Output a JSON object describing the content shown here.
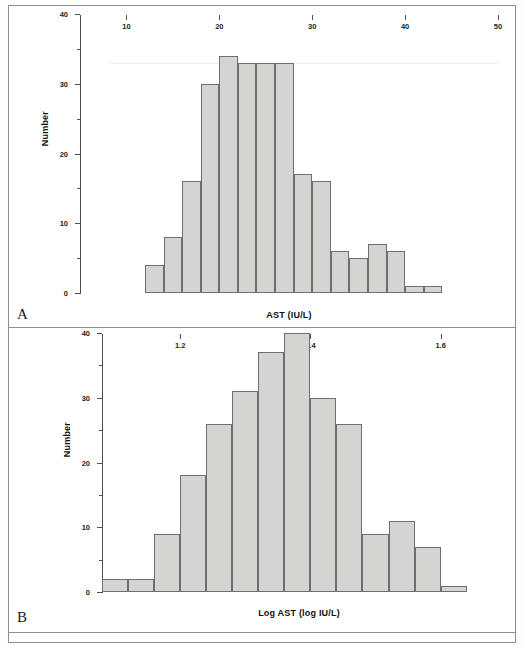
{
  "figure": {
    "panels": [
      {
        "letter": "A",
        "id": "panel-a",
        "xlabel": "AST (IU/L)",
        "ylabel": "Number"
      },
      {
        "letter": "B",
        "id": "panel-b",
        "xlabel": "Log AST (log IU/L)",
        "ylabel": "Number"
      }
    ]
  },
  "chart_data": [
    {
      "type": "bar",
      "title": "",
      "panel": "A",
      "xlabel": "AST (IU/L)",
      "ylabel": "Number",
      "xlim": [
        5,
        50
      ],
      "ylim": [
        0,
        40
      ],
      "xticks": [
        10,
        20,
        30,
        40,
        50
      ],
      "xtick_labels": [
        "10",
        "20",
        "30",
        "40",
        "50"
      ],
      "yticks": [
        0,
        10,
        20,
        30,
        40
      ],
      "ytick_labels": [
        "0",
        "10",
        "20",
        "30",
        "40"
      ],
      "bin_width": 2,
      "grid": false,
      "legend": false,
      "bins": [
        {
          "x0": 12,
          "x1": 14,
          "value": 4
        },
        {
          "x0": 14,
          "x1": 16,
          "value": 8
        },
        {
          "x0": 16,
          "x1": 18,
          "value": 16
        },
        {
          "x0": 18,
          "x1": 20,
          "value": 30
        },
        {
          "x0": 20,
          "x1": 22,
          "value": 34
        },
        {
          "x0": 22,
          "x1": 24,
          "value": 33
        },
        {
          "x0": 24,
          "x1": 26,
          "value": 33
        },
        {
          "x0": 26,
          "x1": 28,
          "value": 33
        },
        {
          "x0": 28,
          "x1": 30,
          "value": 17
        },
        {
          "x0": 30,
          "x1": 32,
          "value": 16
        },
        {
          "x0": 32,
          "x1": 34,
          "value": 6
        },
        {
          "x0": 34,
          "x1": 36,
          "value": 5
        },
        {
          "x0": 36,
          "x1": 38,
          "value": 7
        },
        {
          "x0": 38,
          "x1": 40,
          "value": 6
        },
        {
          "x0": 40,
          "x1": 42,
          "value": 1
        },
        {
          "x0": 42,
          "x1": 44,
          "value": 1
        }
      ]
    },
    {
      "type": "bar",
      "title": "",
      "panel": "B",
      "xlabel": "Log AST (log IU/L)",
      "ylabel": "Number",
      "xlim": [
        1.08,
        1.685
      ],
      "ylim": [
        0,
        40
      ],
      "xticks": [
        1.2,
        1.4,
        1.6
      ],
      "xtick_labels": [
        "1.2",
        "1.4",
        "1.6"
      ],
      "yticks": [
        0,
        10,
        20,
        30,
        40
      ],
      "ytick_labels": [
        "0",
        "10",
        "20",
        "30",
        "40"
      ],
      "bin_width": 0.04,
      "grid": false,
      "legend": false,
      "bins": [
        {
          "x0": 1.08,
          "x1": 1.12,
          "value": 2
        },
        {
          "x0": 1.12,
          "x1": 1.16,
          "value": 2
        },
        {
          "x0": 1.16,
          "x1": 1.2,
          "value": 9
        },
        {
          "x0": 1.2,
          "x1": 1.24,
          "value": 18
        },
        {
          "x0": 1.24,
          "x1": 1.28,
          "value": 26
        },
        {
          "x0": 1.28,
          "x1": 1.32,
          "value": 31
        },
        {
          "x0": 1.32,
          "x1": 1.36,
          "value": 37
        },
        {
          "x0": 1.36,
          "x1": 1.4,
          "value": 40
        },
        {
          "x0": 1.4,
          "x1": 1.44,
          "value": 30
        },
        {
          "x0": 1.44,
          "x1": 1.48,
          "value": 26
        },
        {
          "x0": 1.48,
          "x1": 1.52,
          "value": 9
        },
        {
          "x0": 1.52,
          "x1": 1.56,
          "value": 11
        },
        {
          "x0": 1.56,
          "x1": 1.6,
          "value": 7
        },
        {
          "x0": 1.6,
          "x1": 1.64,
          "value": 1
        }
      ]
    }
  ],
  "colors": {
    "bar_fill": "#d4d4d2",
    "bar_stroke": "#6d6f72",
    "axis": "#4d4f52",
    "frame": "#8c8f91",
    "text": "#1d1e20",
    "background": "#ffffff"
  }
}
